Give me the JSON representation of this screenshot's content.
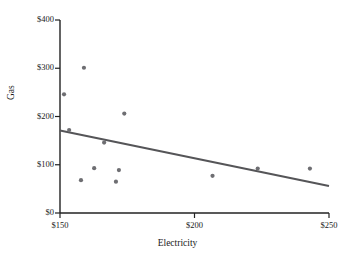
{
  "chart_data": {
    "type": "scatter",
    "title": "",
    "xlabel": "Electricity",
    "ylabel": "Gas",
    "xlim": [
      150,
      250
    ],
    "ylim": [
      0,
      400
    ],
    "xticks": [
      150,
      200,
      250
    ],
    "xtick_labels": [
      "$150",
      "$200",
      "$250"
    ],
    "yticks": [
      0,
      100,
      200,
      300,
      400
    ],
    "ytick_labels": [
      "$0",
      "$100",
      "$200",
      "$300",
      "$400"
    ],
    "grid": false,
    "legend": false,
    "marker_color": "#6e6e72",
    "line_color": "#555558",
    "axis_color": "#222222",
    "points": [
      {
        "x": 151.5,
        "y": 246
      },
      {
        "x": 153.4,
        "y": 172
      },
      {
        "x": 158.9,
        "y": 301
      },
      {
        "x": 157.8,
        "y": 68
      },
      {
        "x": 162.7,
        "y": 93
      },
      {
        "x": 166.4,
        "y": 146
      },
      {
        "x": 170.8,
        "y": 65
      },
      {
        "x": 171.9,
        "y": 89
      },
      {
        "x": 173.9,
        "y": 206
      },
      {
        "x": 206.7,
        "y": 77
      },
      {
        "x": 223.5,
        "y": 92
      },
      {
        "x": 242.9,
        "y": 92
      }
    ],
    "trendline": {
      "x_start": 150,
      "y_start": 171,
      "x_end": 250,
      "y_end": 56
    }
  }
}
